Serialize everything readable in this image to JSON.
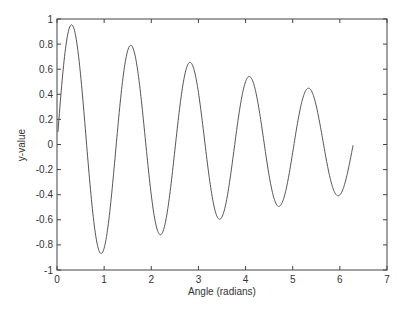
{
  "chart_data": {
    "type": "line",
    "title": "",
    "xlabel": "Angle (radians)",
    "ylabel": "y-value",
    "xlim": [
      0,
      7
    ],
    "ylim": [
      -1,
      1
    ],
    "grid": false,
    "legend": null,
    "xticks": [
      0,
      1,
      2,
      3,
      4,
      5,
      6,
      7
    ],
    "yticks": [
      -1,
      -0.8,
      -0.6,
      -0.4,
      -0.2,
      0,
      0.2,
      0.4,
      0.6,
      0.8,
      1
    ],
    "xtick_labels": [
      "0",
      "1",
      "2",
      "3",
      "4",
      "5",
      "6",
      "7"
    ],
    "ytick_labels": [
      "-1",
      "-0.8",
      "-0.6",
      "-0.4",
      "-0.2",
      "0",
      "0.2",
      "0.4",
      "0.6",
      "0.8",
      "1"
    ],
    "series": [
      {
        "name": "y = exp(-0.15x)·sin(5x)",
        "color": "#555555",
        "x": [
          0.02,
          0.1,
          0.2,
          0.31,
          0.45,
          0.6,
          0.75,
          0.94,
          1.1,
          1.25,
          1.4,
          1.57,
          1.75,
          1.9,
          2.05,
          2.2,
          2.35,
          2.5,
          2.65,
          2.83,
          3.0,
          3.15,
          3.3,
          3.46,
          3.6,
          3.75,
          3.9,
          4.08,
          4.25,
          4.4,
          4.55,
          4.71,
          4.85,
          5.0,
          5.15,
          5.34,
          5.5,
          5.65,
          5.8,
          5.97,
          6.1,
          6.28
        ],
        "y": [
          0.1,
          0.47,
          0.82,
          0.95,
          0.73,
          0.13,
          -0.52,
          -0.87,
          -0.6,
          -0.02,
          0.57,
          0.79,
          0.48,
          -0.09,
          -0.58,
          -0.72,
          -0.39,
          0.13,
          0.55,
          0.65,
          0.41,
          -0.02,
          -0.43,
          -0.59,
          -0.43,
          -0.06,
          0.32,
          0.53,
          0.35,
          0.0,
          -0.33,
          -0.49,
          -0.33,
          -0.0,
          0.31,
          0.44,
          0.29,
          0.03,
          -0.26,
          -0.41,
          -0.3,
          -0.02
        ]
      }
    ],
    "peaks": [
      {
        "x": 0.31,
        "y": 0.95
      },
      {
        "x": 1.57,
        "y": 0.79
      },
      {
        "x": 2.83,
        "y": 0.65
      },
      {
        "x": 4.08,
        "y": 0.53
      },
      {
        "x": 5.34,
        "y": 0.44
      }
    ],
    "troughs": [
      {
        "x": 0.94,
        "y": -0.87
      },
      {
        "x": 2.2,
        "y": -0.72
      },
      {
        "x": 3.46,
        "y": -0.59
      },
      {
        "x": 4.71,
        "y": -0.49
      },
      {
        "x": 5.97,
        "y": -0.41
      }
    ]
  }
}
